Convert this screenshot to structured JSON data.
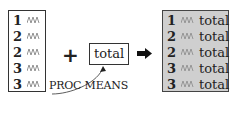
{
  "input_table": {
    "rows": [
      {
        "id": "1",
        "value": "squiggle"
      },
      {
        "id": "2",
        "value": "squiggle"
      },
      {
        "id": "2",
        "value": "squiggle"
      },
      {
        "id": "3",
        "value": "squiggle"
      },
      {
        "id": "3",
        "value": "squiggle"
      }
    ]
  },
  "operator": "+",
  "summary_box": {
    "label": "total"
  },
  "annotation": {
    "label": "PROC MEANS"
  },
  "result_arrow": "right-arrow",
  "output_table": {
    "fill_color": "#cfcfcf",
    "rows": [
      {
        "id": "1",
        "value": "squiggle",
        "total": "total"
      },
      {
        "id": "2",
        "value": "squiggle",
        "total": "total"
      },
      {
        "id": "2",
        "value": "squiggle",
        "total": "total"
      },
      {
        "id": "3",
        "value": "squiggle",
        "total": "total"
      },
      {
        "id": "3",
        "value": "squiggle",
        "total": "total"
      }
    ]
  }
}
